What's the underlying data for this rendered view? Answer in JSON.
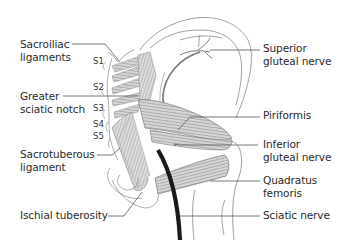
{
  "diagram": {
    "labels_left": [
      {
        "id": "sacroiliac-ligaments",
        "lines": [
          "Sacroiliac",
          "ligaments"
        ]
      },
      {
        "id": "greater-sciatic-notch",
        "lines": [
          "Greater",
          "sciatic notch"
        ]
      },
      {
        "id": "sacrotuberous-ligament",
        "lines": [
          "Sacrotuberous",
          "ligament"
        ]
      },
      {
        "id": "ischial-tuberosity",
        "lines": [
          "Ischial tuberosity"
        ]
      }
    ],
    "labels_right": [
      {
        "id": "superior-gluteal-nerve",
        "lines": [
          "Superior",
          "gluteal nerve"
        ]
      },
      {
        "id": "piriformis",
        "lines": [
          "Piriformis"
        ]
      },
      {
        "id": "inferior-gluteal-nerve",
        "lines": [
          "Inferior",
          "gluteal nerve"
        ]
      },
      {
        "id": "quadratus-femoris",
        "lines": [
          "Quadratus",
          "femoris"
        ]
      },
      {
        "id": "sciatic-nerve",
        "lines": [
          "Sciatic nerve"
        ]
      }
    ],
    "sacral_levels": [
      "S1",
      "S2",
      "S3",
      "S4",
      "S5"
    ],
    "colors": {
      "outline": "#8a8a8a",
      "muscle_fill": "#d4d4d4",
      "muscle_stripe": "#9a9a9a",
      "nerve": "#1a1a1a",
      "leader_line": "#555555",
      "text": "#2a2a2a"
    }
  }
}
